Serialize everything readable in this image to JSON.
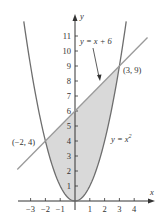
{
  "chart_data": {
    "type": "area",
    "title": "",
    "xlabel": "x",
    "ylabel": "y",
    "xlim": [
      -3.9,
      5.2
    ],
    "ylim": [
      0,
      12
    ],
    "grid": false,
    "x_ticks": [
      -3,
      -2,
      -1,
      1,
      2,
      3,
      4
    ],
    "x_tick_labels": [
      "−3",
      "−2",
      "−1",
      "1",
      "2",
      "3",
      "4"
    ],
    "y_ticks": [
      1,
      2,
      3,
      4,
      5,
      6,
      7,
      8,
      9,
      10,
      11
    ],
    "y_tick_labels": [
      "1",
      "2",
      "3",
      "4",
      "5",
      "6",
      "7",
      "8",
      "9",
      "10",
      "11"
    ],
    "series": [
      {
        "name": "y = x^2",
        "label": "y = x",
        "label_sup": "2",
        "type": "curve",
        "function": "x^2",
        "x_range": [
          -3.46,
          3.46
        ],
        "color": "#6e6e6e"
      },
      {
        "name": "y = x + 6",
        "label": "y = x + 6",
        "type": "line",
        "function": "x + 6",
        "x_range": [
          -3.9,
          4.9
        ],
        "color": "#9a9a9a"
      }
    ],
    "shaded_region": {
      "description": "Region between y = x + 6 (top) and y = x^2 (bottom)",
      "x_range": [
        -2,
        3
      ],
      "color": "#d9d9d9"
    },
    "annotations": [
      {
        "text": "(3, 9)",
        "x": 3,
        "y": 9
      },
      {
        "text": "(−2, 4)",
        "x": -2,
        "y": 4
      }
    ]
  },
  "labels": {
    "x_axis": "x",
    "y_axis": "y",
    "line_eq": "y = x + 6",
    "parabola_eq": "y = x",
    "parabola_sup": "2",
    "point_a": "(3, 9)",
    "point_b": "(−2, 4)"
  }
}
